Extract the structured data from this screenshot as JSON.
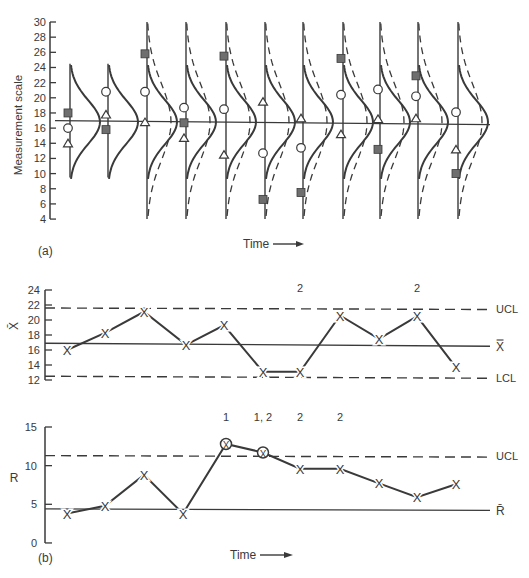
{
  "chart_data": [
    {
      "panel": "(a)",
      "type": "scatter",
      "title": "",
      "ylabel": "Measurement scale",
      "xlabel": "Time",
      "ylim": [
        4,
        30
      ],
      "yticks": [
        4,
        6,
        8,
        10,
        12,
        14,
        16,
        18,
        20,
        22,
        24,
        26,
        28,
        30
      ],
      "center_line": 16.8,
      "description": "Sequence of 11 subgroups with process distribution curves; solid = process distribution, dashed = widened distribution from subgroup 3 onward",
      "subgroups": [
        {
          "t": 1,
          "square": 18,
          "circle": 16,
          "triangle": 14,
          "dashed": false
        },
        {
          "t": 2,
          "square": 15.8,
          "circle": 20.8,
          "triangle": 17.8,
          "dashed": false
        },
        {
          "t": 3,
          "square": 25.8,
          "circle": 20.8,
          "triangle": 16.8,
          "dashed": true
        },
        {
          "t": 4,
          "square": 16.7,
          "circle": 18.7,
          "triangle": 14.7,
          "dashed": true
        },
        {
          "t": 5,
          "square": 25.5,
          "circle": 18.5,
          "triangle": 12.5,
          "dashed": true
        },
        {
          "t": 6,
          "square": 6.6,
          "circle": 12.7,
          "triangle": 19.5,
          "dashed": true
        },
        {
          "t": 7,
          "square": 7.5,
          "circle": 13.4,
          "triangle": 17.3,
          "dashed": true
        },
        {
          "t": 8,
          "square": 25.2,
          "circle": 20.4,
          "triangle": 15.2,
          "dashed": true
        },
        {
          "t": 9,
          "square": 13.2,
          "circle": 21.1,
          "triangle": 17.2,
          "dashed": true
        },
        {
          "t": 10,
          "square": 22.9,
          "circle": 20.2,
          "triangle": 17.3,
          "dashed": true
        },
        {
          "t": 11,
          "square": 10,
          "circle": 18.1,
          "triangle": 13.2,
          "dashed": true
        }
      ]
    },
    {
      "panel": "(b) top",
      "type": "line",
      "ylabel": "X̄",
      "ylim": [
        12,
        24
      ],
      "yticks": [
        12,
        14,
        16,
        18,
        20,
        22,
        24
      ],
      "x": [
        1,
        2,
        3,
        4,
        5,
        6,
        7,
        8,
        9,
        10,
        11
      ],
      "values": [
        16,
        18.3,
        21.1,
        16.7,
        19.3,
        13.1,
        13.1,
        20.6,
        17.5,
        20.5,
        13.7
      ],
      "UCL": 21.6,
      "center": 16.9,
      "LCL": 12.5,
      "annotations": [
        {
          "x": 7,
          "label": "2"
        },
        {
          "x": 10,
          "label": "2"
        }
      ],
      "line_labels": {
        "ucl": "UCL",
        "center": "X̿",
        "lcl": "LCL"
      }
    },
    {
      "panel": "(b) bottom",
      "type": "line",
      "ylabel": "R",
      "xlabel": "Time",
      "ylim": [
        0,
        15
      ],
      "yticks": [
        0,
        5,
        10,
        15
      ],
      "x": [
        1,
        2,
        3,
        4,
        5,
        6,
        7,
        8,
        9,
        10,
        11
      ],
      "values": [
        3.8,
        4.8,
        8.8,
        3.8,
        12.8,
        11.7,
        9.6,
        9.6,
        7.7,
        5.9,
        7.6
      ],
      "circled_points": [
        5,
        6
      ],
      "UCL": 11.3,
      "center": 4.4,
      "annotations": [
        {
          "x": 5,
          "label": "1"
        },
        {
          "x": 6,
          "label": "1, 2"
        },
        {
          "x": 7,
          "label": "2"
        },
        {
          "x": 8,
          "label": "2"
        }
      ],
      "line_labels": {
        "ucl": "UCL",
        "center": "R̄"
      }
    }
  ],
  "labels": {
    "panel_a": "(a)",
    "panel_b": "(b)",
    "time": "Time",
    "measurement_scale": "Measurement scale",
    "xbar_axis": "X̄",
    "r_axis": "R",
    "ucl": "UCL",
    "lcl": "LCL",
    "xbarbar": "X̿",
    "rbar": "R̄"
  },
  "colors": {
    "ink": "#3a3a3a",
    "marker_fill": "#6e6e6e",
    "background": "#ffffff"
  }
}
